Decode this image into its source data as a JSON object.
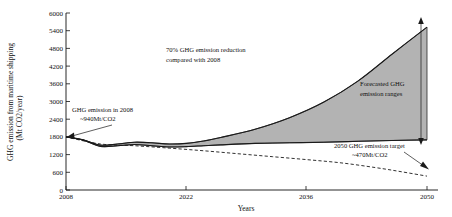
{
  "chart_data": {
    "type": "area",
    "title": "",
    "xlabel": "Years",
    "ylabel": "GHG emission from maritime shipping (Mt CO2/year)",
    "ylabel_line1": "GHG emission from maritime shipping",
    "ylabel_line2": "(Mt CO2/year)",
    "xlim": [
      2008,
      2050
    ],
    "ylim": [
      0,
      6000
    ],
    "grid": false,
    "legend": "none",
    "xticks": [
      2008,
      2022,
      2036,
      2050
    ],
    "xtick_labels": [
      "2008",
      "2022",
      "2036",
      "2050"
    ],
    "yticks": [
      0,
      600,
      1200,
      1800,
      2400,
      3000,
      3600,
      4200,
      4800,
      5400,
      6000
    ],
    "ytick_labels": [
      "0",
      "600",
      "1200",
      "1800",
      "2400",
      "3000",
      "3600",
      "4200",
      "4800",
      "5400",
      "6000"
    ],
    "series": [
      {
        "name": "Forecast upper bound",
        "style": "solid",
        "x": [
          2008,
          2010,
          2012,
          2014,
          2016,
          2018,
          2020,
          2022,
          2024,
          2026,
          2030,
          2034,
          2038,
          2042,
          2046,
          2050
        ],
        "values": [
          1800,
          1700,
          1520,
          1560,
          1620,
          1600,
          1560,
          1580,
          1660,
          1780,
          2060,
          2450,
          2980,
          3700,
          4620,
          5520
        ]
      },
      {
        "name": "Forecast lower bound",
        "style": "solid",
        "x": [
          2008,
          2010,
          2012,
          2014,
          2016,
          2018,
          2020,
          2022,
          2024,
          2026,
          2030,
          2034,
          2038,
          2042,
          2046,
          2050
        ],
        "values": [
          1800,
          1690,
          1480,
          1500,
          1540,
          1500,
          1460,
          1470,
          1500,
          1530,
          1580,
          1600,
          1620,
          1650,
          1680,
          1700
        ]
      },
      {
        "name": "2050 GHG emission target trajectory",
        "style": "dashed",
        "x": [
          2008,
          2012,
          2016,
          2020,
          2024,
          2028,
          2032,
          2036,
          2040,
          2044,
          2047,
          2050
        ],
        "values": [
          1800,
          1560,
          1500,
          1420,
          1330,
          1230,
          1130,
          1030,
          920,
          760,
          620,
          470
        ]
      }
    ],
    "annotations": [
      {
        "name": "reduction-note",
        "line1": "70% GHG emission reduction",
        "line2": "compared with 2008"
      },
      {
        "name": "emission-2008-note",
        "line1": "GHG emission in 2008",
        "line2": "~940Mt/CO2"
      },
      {
        "name": "forecast-range-note",
        "line1": "Forecasted GHG",
        "line2": "emission ranges"
      },
      {
        "name": "target-2050-note",
        "line1": "2050 GHG emission target",
        "line2": "~470Mt/CO2"
      }
    ],
    "colors": {
      "band_fill": "#a9a9a9",
      "line": "#1a1a1a",
      "axis": "#111111",
      "background": "#ffffff"
    }
  }
}
